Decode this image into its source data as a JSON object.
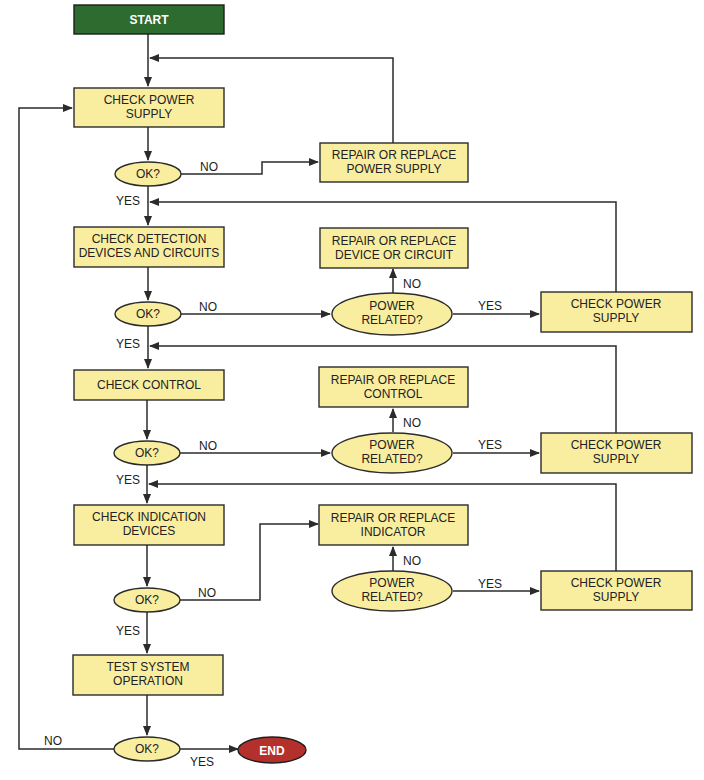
{
  "flowchart": {
    "start": "START",
    "end": "END",
    "steps": {
      "check_power_supply": [
        "CHECK POWER",
        "SUPPLY"
      ],
      "check_detection": [
        "CHECK DETECTION",
        "DEVICES AND CIRCUITS"
      ],
      "check_control": [
        "CHECK CONTROL"
      ],
      "check_indication": [
        "CHECK INDICATION",
        "DEVICES"
      ],
      "test_system": [
        "TEST SYSTEM",
        "OPERATION"
      ]
    },
    "repairs": {
      "power_supply": [
        "REPAIR OR REPLACE",
        "POWER SUPPLY"
      ],
      "device_circuit": [
        "REPAIR OR REPLACE",
        "DEVICE OR CIRCUIT"
      ],
      "control": [
        "REPAIR OR REPLACE",
        "CONTROL"
      ],
      "indicator": [
        "REPAIR OR REPLACE",
        "INDICATOR"
      ]
    },
    "side_checks": [
      "CHECK POWER",
      "SUPPLY"
    ],
    "decisions": {
      "ok": "OK?",
      "power_related": [
        "POWER",
        "RELATED?"
      ]
    },
    "labels": {
      "yes": "YES",
      "no": "NO"
    },
    "colors": {
      "box_fill": "#f9eea0",
      "start_fill": "#2e6b2e",
      "end_fill": "#b3302c",
      "stroke": "#2b2b2b"
    }
  }
}
